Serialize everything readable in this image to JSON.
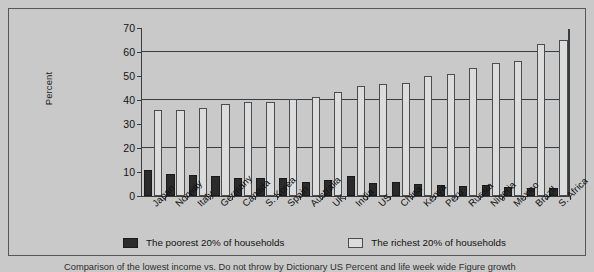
{
  "chart_data": {
    "type": "bar",
    "title": "",
    "xlabel": "",
    "ylabel": "Percent",
    "ylim": [
      0,
      70
    ],
    "ytick_values": [
      0,
      10,
      20,
      30,
      40,
      50,
      60,
      70
    ],
    "gridlines": [
      20,
      40,
      60
    ],
    "grid": true,
    "legend_position": "bottom",
    "categories": [
      "Japan",
      "Norway",
      "Italy",
      "Germany",
      "Canada",
      "S. Korea",
      "Spain",
      "Australia",
      "UK",
      "India",
      "US",
      "China",
      "Kenya",
      "Peru",
      "Russia",
      "Nigeria",
      "Mexico",
      "Brazil",
      "S. Africa"
    ],
    "series": [
      {
        "name": "The poorest 20% of households",
        "color": "#2b2b2b",
        "values": [
          10.8,
          9.2,
          8.6,
          8.3,
          7.6,
          7.5,
          7.5,
          6.0,
          6.6,
          8.4,
          5.4,
          5.9,
          5.1,
          4.4,
          4.3,
          4.4,
          3.9,
          3.2,
          3.5
        ]
      },
      {
        "name": "The richest 20% of households",
        "color": "#dcdcdc",
        "values": [
          35.7,
          35.8,
          36.6,
          38.5,
          39.3,
          39.3,
          40.5,
          41.3,
          43.4,
          45.7,
          46.5,
          47.2,
          50.1,
          51.0,
          53.4,
          55.6,
          56.2,
          63.2,
          64.9
        ]
      }
    ]
  },
  "legend": {
    "poorest_label": "The poorest 20% of households",
    "richest_label": "The richest 20% of households"
  },
  "caption": "Comparison of the lowest income vs. Do not throw by Dictionary US Percent and life week wide Figure growth"
}
